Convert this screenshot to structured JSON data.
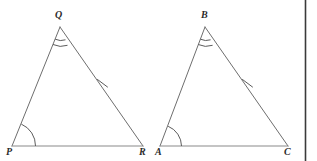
{
  "figure": {
    "background_color": "#ffffff",
    "stroke_color": "#6e6e6e",
    "label_color": "#2b2b2b",
    "width": 317,
    "height": 161
  },
  "labels": {
    "q": "Q",
    "p": "P",
    "r": "R",
    "b": "B",
    "a": "A",
    "c": "C"
  },
  "triangles": [
    {
      "name": "PQR",
      "vertices": {
        "P": [
          12,
          146
        ],
        "Q": [
          60,
          27
        ],
        "R": [
          143,
          146
        ]
      },
      "marks": {
        "apex_angle_arcs": 2,
        "base_left_angle_arcs": 1,
        "hypotenuse_ticks": 1
      }
    },
    {
      "name": "ABC",
      "vertices": {
        "A": [
          160,
          146
        ],
        "B": [
          205,
          27
        ],
        "C": [
          288,
          146
        ]
      },
      "marks": {
        "apex_angle_arcs": 2,
        "base_left_angle_arcs": 1,
        "hypotenuse_ticks": 1
      }
    }
  ],
  "edge_rule": {
    "name": "right-page-edge-line",
    "x": 305.5,
    "y1": 0,
    "y2": 161,
    "color": "#3a3a3a"
  }
}
